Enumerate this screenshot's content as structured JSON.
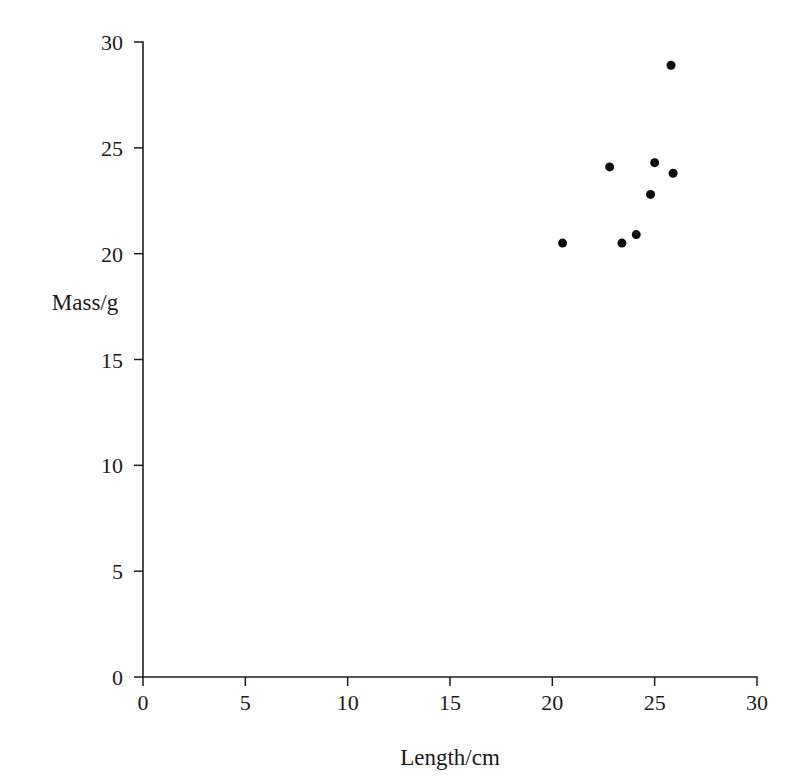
{
  "chart_data": {
    "type": "scatter",
    "title": "",
    "xlabel": "Length/cm",
    "ylabel": "Mass/g",
    "xlim": [
      0,
      30
    ],
    "ylim": [
      0,
      30
    ],
    "xticks": [
      0,
      5,
      10,
      15,
      20,
      25,
      30
    ],
    "yticks": [
      0,
      5,
      10,
      15,
      20,
      25,
      30
    ],
    "xtick_labels": [
      "0",
      "5",
      "10",
      "15",
      "20",
      "25",
      "30"
    ],
    "ytick_labels": [
      "0",
      "5",
      "10",
      "15",
      "20",
      "25",
      "30"
    ],
    "grid": false,
    "legend": null,
    "marker": {
      "shape": "circle",
      "color": "#0d0d0d",
      "size_px": 9
    },
    "series": [
      {
        "name": "Mass vs Length",
        "x": [
          20.5,
          22.8,
          23.4,
          24.1,
          24.8,
          25.0,
          25.9,
          25.8
        ],
        "y": [
          20.5,
          24.1,
          20.5,
          20.9,
          22.8,
          24.3,
          23.8,
          28.9
        ]
      }
    ]
  },
  "labels": {
    "x_axis_title": "Length/cm",
    "y_axis_title": "Mass/g"
  }
}
